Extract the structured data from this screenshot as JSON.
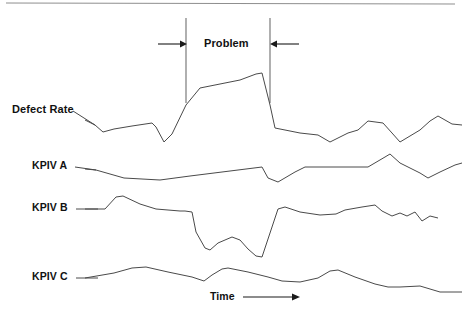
{
  "figure": {
    "title_fragment_top": "",
    "background_color": "#ffffff",
    "line_color": "#4a4a4a",
    "text_color": "#111111"
  },
  "labels": {
    "defect_rate": "Defect Rate",
    "kpiv_a": "KPIV A",
    "kpiv_b": "KPIV B",
    "kpiv_c": "KPIV C",
    "problem": "Problem",
    "time": "Time"
  },
  "annotations": {
    "problem_window": {
      "label": "Problem",
      "left_boundary_x": 186,
      "right_boundary_x": 270,
      "arrow_left_from_x": 158,
      "arrow_right_from_x": 299
    },
    "time_axis": {
      "label": "Time",
      "arrow_from_x": 243,
      "arrow_to_x": 299,
      "y": 297
    }
  },
  "chart_data": {
    "type": "line",
    "title": "",
    "xlabel": "Time",
    "ylabel": "",
    "grid": false,
    "legend_position": "inline-left-labels",
    "axis_ranges": {
      "x": [
        85,
        462
      ],
      "y_panels": "stacked, unscaled (schematic)"
    },
    "annotation_band": {
      "label": "Problem",
      "x_start": 186,
      "x_end": 270
    },
    "series": [
      {
        "name": "Defect Rate",
        "label_x": 12,
        "label_y": 110,
        "leader_from": [
          73,
          111
        ],
        "leader_to": [
          95,
          125
        ],
        "points": [
          [
            85,
            120
          ],
          [
            95,
            125
          ],
          [
            103,
            132
          ],
          [
            114,
            129
          ],
          [
            132,
            126
          ],
          [
            152,
            123
          ],
          [
            156,
            127
          ],
          [
            164,
            142
          ],
          [
            172,
            134
          ],
          [
            186,
            105
          ],
          [
            200,
            88
          ],
          [
            220,
            84
          ],
          [
            240,
            80
          ],
          [
            256,
            74
          ],
          [
            262,
            73
          ],
          [
            270,
            105
          ],
          [
            275,
            128
          ],
          [
            300,
            133
          ],
          [
            318,
            135
          ],
          [
            330,
            142
          ],
          [
            348,
            133
          ],
          [
            358,
            130
          ],
          [
            368,
            121
          ],
          [
            383,
            123
          ],
          [
            392,
            133
          ],
          [
            400,
            142
          ],
          [
            420,
            130
          ],
          [
            430,
            121
          ],
          [
            438,
            116
          ],
          [
            452,
            124
          ],
          [
            462,
            125
          ]
        ]
      },
      {
        "name": "KPIV A",
        "label_x": 32,
        "label_y": 166,
        "leader_from": [
          75,
          167
        ],
        "leader_to": [
          96,
          170
        ],
        "points": [
          [
            85,
            169
          ],
          [
            96,
            170
          ],
          [
            124,
            178
          ],
          [
            160,
            180
          ],
          [
            190,
            176
          ],
          [
            214,
            173
          ],
          [
            246,
            169
          ],
          [
            262,
            167
          ],
          [
            268,
            178
          ],
          [
            278,
            182
          ],
          [
            295,
            172
          ],
          [
            305,
            167
          ],
          [
            350,
            167
          ],
          [
            368,
            167
          ],
          [
            385,
            157
          ],
          [
            390,
            154
          ],
          [
            400,
            163
          ],
          [
            420,
            173
          ],
          [
            428,
            178
          ],
          [
            440,
            172
          ],
          [
            455,
            165
          ],
          [
            462,
            163
          ]
        ]
      },
      {
        "name": "KPIV B",
        "label_x": 32,
        "label_y": 208,
        "leader_from": [
          76,
          209
        ],
        "leader_to": [
          98,
          209
        ],
        "points": [
          [
            85,
            209
          ],
          [
            105,
            209
          ],
          [
            116,
            197
          ],
          [
            123,
            196
          ],
          [
            140,
            204
          ],
          [
            156,
            209
          ],
          [
            180,
            211
          ],
          [
            185,
            211
          ],
          [
            192,
            212
          ],
          [
            196,
            232
          ],
          [
            205,
            248
          ],
          [
            210,
            250
          ],
          [
            218,
            243
          ],
          [
            232,
            237
          ],
          [
            240,
            240
          ],
          [
            248,
            249
          ],
          [
            256,
            256
          ],
          [
            262,
            257
          ],
          [
            278,
            209
          ],
          [
            285,
            207
          ],
          [
            300,
            212
          ],
          [
            320,
            215
          ],
          [
            336,
            214
          ],
          [
            345,
            210
          ],
          [
            362,
            207
          ],
          [
            375,
            205
          ],
          [
            382,
            211
          ],
          [
            392,
            216
          ],
          [
            400,
            213
          ],
          [
            407,
            216
          ],
          [
            415,
            212
          ],
          [
            422,
            221
          ],
          [
            430,
            216
          ],
          [
            438,
            218
          ]
        ]
      },
      {
        "name": "KPIV C",
        "label_x": 32,
        "label_y": 277,
        "leader_from": [
          76,
          278
        ],
        "leader_to": [
          98,
          278
        ],
        "points": [
          [
            85,
            278
          ],
          [
            114,
            273
          ],
          [
            132,
            268
          ],
          [
            146,
            267
          ],
          [
            168,
            272
          ],
          [
            192,
            277
          ],
          [
            204,
            281
          ],
          [
            212,
            275
          ],
          [
            222,
            269
          ],
          [
            228,
            268
          ],
          [
            248,
            272
          ],
          [
            268,
            277
          ],
          [
            282,
            281
          ],
          [
            300,
            282
          ],
          [
            318,
            278
          ],
          [
            330,
            271
          ],
          [
            338,
            270
          ],
          [
            355,
            277
          ],
          [
            375,
            284
          ],
          [
            388,
            287
          ],
          [
            400,
            287
          ],
          [
            420,
            286
          ],
          [
            430,
            289
          ],
          [
            440,
            292
          ],
          [
            452,
            292
          ],
          [
            462,
            292
          ]
        ]
      }
    ]
  }
}
